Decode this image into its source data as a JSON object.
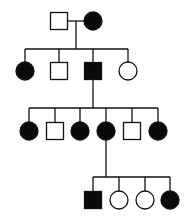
{
  "diagram": {
    "type": "pedigree",
    "colors": {
      "line": "#111111",
      "affected": "#0a0a0a",
      "unaffected": "#ffffff"
    },
    "generations": [
      {
        "id": "I",
        "individuals": [
          {
            "id": "I-1",
            "sex": "male",
            "affected": false,
            "x": 59,
            "y": 21
          },
          {
            "id": "I-2",
            "sex": "female",
            "affected": true,
            "x": 93,
            "y": 21
          }
        ]
      },
      {
        "id": "II",
        "individuals": [
          {
            "id": "II-1",
            "sex": "female",
            "affected": true,
            "x": 25,
            "y": 71
          },
          {
            "id": "II-2",
            "sex": "male",
            "affected": false,
            "x": 59,
            "y": 71
          },
          {
            "id": "II-3",
            "sex": "male",
            "affected": true,
            "x": 93,
            "y": 71
          },
          {
            "id": "II-4",
            "sex": "female",
            "affected": false,
            "x": 128,
            "y": 71
          }
        ]
      },
      {
        "id": "III",
        "individuals": [
          {
            "id": "III-1",
            "sex": "female",
            "affected": true,
            "x": 29,
            "y": 131
          },
          {
            "id": "III-2",
            "sex": "male",
            "affected": false,
            "x": 55,
            "y": 131
          },
          {
            "id": "III-3",
            "sex": "female",
            "affected": true,
            "x": 80,
            "y": 131
          },
          {
            "id": "III-4",
            "sex": "female",
            "affected": true,
            "x": 106,
            "y": 131
          },
          {
            "id": "III-5",
            "sex": "male",
            "affected": false,
            "x": 132,
            "y": 131
          },
          {
            "id": "III-6",
            "sex": "female",
            "affected": true,
            "x": 158,
            "y": 131
          }
        ]
      },
      {
        "id": "IV",
        "individuals": [
          {
            "id": "IV-1",
            "sex": "male",
            "affected": true,
            "x": 93,
            "y": 200
          },
          {
            "id": "IV-2",
            "sex": "female",
            "affected": false,
            "x": 119,
            "y": 200
          },
          {
            "id": "IV-3",
            "sex": "female",
            "affected": false,
            "x": 145,
            "y": 200
          },
          {
            "id": "IV-4",
            "sex": "female",
            "affected": true,
            "x": 170,
            "y": 200
          }
        ]
      }
    ],
    "matings": [
      {
        "partners": [
          "I-1",
          "I-2"
        ],
        "line_y": 21,
        "drop_x": 76,
        "sibship_y": 49,
        "children": "II"
      },
      {
        "parent": "II-3",
        "drop_x": 93,
        "sibship_y": 108,
        "children": "III"
      },
      {
        "parent": "III-4",
        "drop_x": 106,
        "sibship_y": 177,
        "children": "IV"
      }
    ],
    "symbol_size": 17
  }
}
